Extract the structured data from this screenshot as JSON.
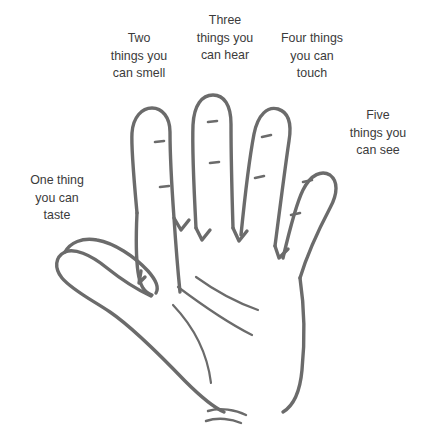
{
  "page": {
    "background_color": "#ffffff",
    "width": 425,
    "height": 443
  },
  "illustration": {
    "name": "open-hand-line-drawing",
    "stroke_color": "#6b6b6b",
    "fill_color": "none",
    "description": "Outline drawing of an open right hand with five fingers, knuckle crease marks, palm lines and wrist creases"
  },
  "labels": {
    "taste": "One thing\nyou can\ntaste",
    "smell": "Two\nthings you\ncan smell",
    "hear": "Three\nthings you\ncan hear",
    "touch": "Four things\nyou can\ntouch",
    "see": "Five\nthings you\ncan see"
  },
  "text_color": "#3b3b3b"
}
